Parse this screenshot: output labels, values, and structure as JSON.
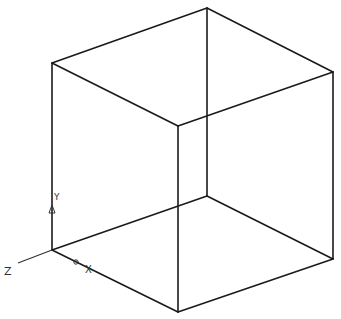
{
  "diagram": {
    "colors": {
      "edge": "#1a1a1a",
      "axis": "#333333",
      "background": "#ffffff"
    },
    "ucs": {
      "labels": {
        "x": "X",
        "y": "Y",
        "z": "Z"
      }
    },
    "cube": {
      "vertex_names": [
        "left-bottom",
        "front-bottom",
        "right-bottom",
        "back-bottom",
        "left-top",
        "front-top",
        "right-top",
        "back-top"
      ],
      "edges": [
        [
          "left-top",
          "back-top"
        ],
        [
          "back-top",
          "right-top"
        ],
        [
          "left-top",
          "front-top"
        ],
        [
          "front-top",
          "right-top"
        ],
        [
          "left-top",
          "left-bottom"
        ],
        [
          "front-top",
          "front-bottom"
        ],
        [
          "right-top",
          "right-bottom"
        ],
        [
          "back-top",
          "back-bottom"
        ],
        [
          "left-bottom",
          "front-bottom"
        ],
        [
          "front-bottom",
          "right-bottom"
        ],
        [
          "left-bottom",
          "back-bottom"
        ],
        [
          "back-bottom",
          "right-bottom"
        ]
      ]
    }
  }
}
